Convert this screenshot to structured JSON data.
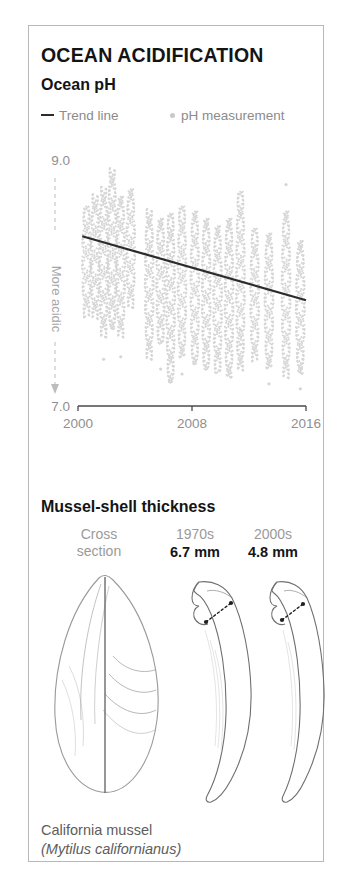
{
  "panel": {
    "title": "OCEAN ACIDIFICATION",
    "subtitle": "Ocean pH",
    "section_title": "Mussel-shell thickness",
    "caption_line1": "California mussel",
    "caption_line2": "(Mytilus californianus)"
  },
  "legend": {
    "trend_label": "Trend line",
    "point_label": "pH measurement",
    "trend_icon": "dash-icon",
    "point_icon": "dot-icon"
  },
  "colors": {
    "border": "#b8b8b8",
    "text": "#141414",
    "muted": "#8f8f8f",
    "dot": "#d5d5d5",
    "trend": "#2b2b2b",
    "shell_outline": "#9a9a9a"
  },
  "shell_columns": [
    {
      "top_line1": "Cross",
      "top_line2": "section",
      "value": ""
    },
    {
      "top_line1": "1970s",
      "top_line2": "",
      "value": "6.7 mm"
    },
    {
      "top_line1": "2000s",
      "top_line2": "",
      "value": "4.8 mm"
    }
  ],
  "chart_data": {
    "type": "scatter",
    "title": "Ocean pH",
    "xlabel": "",
    "ylabel": "More acidic",
    "axis_note": "More acidic",
    "xlim": [
      2000,
      2016
    ],
    "ylim": [
      7.0,
      9.0
    ],
    "yticks": [
      "7.0",
      "9.0"
    ],
    "xticks": [
      "2000",
      "2008",
      "2016"
    ],
    "grid": false,
    "legend_position": "top-left",
    "series": [
      {
        "name": "pH measurement",
        "type": "scatter",
        "color": "#d5d5d5",
        "note": "dense vertical strips of individual pH readings, one strip per sampling period",
        "strips": [
          {
            "x": 2000.6,
            "top": 8.62,
            "bottom": 7.72,
            "outliers": []
          },
          {
            "x": 2001.2,
            "top": 8.72,
            "bottom": 7.7,
            "outliers": []
          },
          {
            "x": 2001.8,
            "top": 8.78,
            "bottom": 7.55,
            "outliers": [
              7.38
            ]
          },
          {
            "x": 2002.4,
            "top": 8.93,
            "bottom": 7.62,
            "outliers": []
          },
          {
            "x": 2003.0,
            "top": 8.7,
            "bottom": 7.56,
            "outliers": [
              7.4
            ]
          },
          {
            "x": 2003.7,
            "top": 8.76,
            "bottom": 7.8,
            "outliers": []
          },
          {
            "x": 2005.0,
            "top": 8.6,
            "bottom": 7.38,
            "outliers": []
          },
          {
            "x": 2005.8,
            "top": 8.52,
            "bottom": 7.5,
            "outliers": [
              7.3
            ]
          },
          {
            "x": 2006.5,
            "top": 8.56,
            "bottom": 7.18,
            "outliers": []
          },
          {
            "x": 2007.3,
            "top": 8.62,
            "bottom": 7.4,
            "outliers": [
              7.26
            ]
          },
          {
            "x": 2008.2,
            "top": 8.58,
            "bottom": 7.34,
            "outliers": []
          },
          {
            "x": 2009.0,
            "top": 8.52,
            "bottom": 7.3,
            "outliers": []
          },
          {
            "x": 2009.8,
            "top": 8.46,
            "bottom": 7.26,
            "outliers": []
          },
          {
            "x": 2010.6,
            "top": 8.52,
            "bottom": 7.22,
            "outliers": []
          },
          {
            "x": 2011.4,
            "top": 8.74,
            "bottom": 7.28,
            "outliers": [
              7.62,
              7.5
            ]
          },
          {
            "x": 2012.4,
            "top": 8.44,
            "bottom": 7.36,
            "outliers": []
          },
          {
            "x": 2013.4,
            "top": 8.4,
            "bottom": 7.3,
            "outliers": [
              7.18
            ]
          },
          {
            "x": 2014.6,
            "top": 8.58,
            "bottom": 7.22,
            "outliers": [
              8.8
            ]
          },
          {
            "x": 2015.6,
            "top": 8.34,
            "bottom": 7.26,
            "outliers": [
              7.14
            ]
          }
        ]
      },
      {
        "name": "Trend line",
        "type": "line",
        "color": "#2b2b2b",
        "x": [
          2000.3,
          2016.0
        ],
        "y": [
          8.38,
          7.86
        ]
      }
    ]
  }
}
